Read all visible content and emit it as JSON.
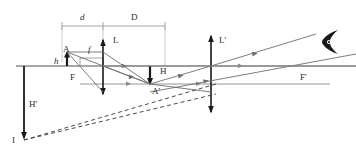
{
  "diagram": {
    "colors": {
      "axis": "#8a8a8a",
      "ray": "#6e6e6e",
      "dashed": "#4a4a4a",
      "object": "#1a1a1a",
      "lens": "#1a1a1a",
      "dimension": "#9a9a9a",
      "label": "#2b2b2b",
      "background": "#ffffff"
    },
    "labels": [
      {
        "id": "d",
        "text": "d",
        "x": 80,
        "y": 20,
        "italic": true
      },
      {
        "id": "D",
        "text": "D",
        "x": 131,
        "y": 20,
        "italic": false
      },
      {
        "id": "L",
        "text": "L",
        "x": 113,
        "y": 43,
        "italic": false
      },
      {
        "id": "f",
        "text": "f",
        "x": 88,
        "y": 52,
        "italic": true
      },
      {
        "id": "A",
        "text": "A",
        "x": 63,
        "y": 52,
        "italic": false
      },
      {
        "id": "h",
        "text": "h",
        "x": 54,
        "y": 64,
        "italic": true
      },
      {
        "id": "F",
        "text": "F",
        "x": 70,
        "y": 80,
        "italic": false
      },
      {
        "id": "H",
        "text": "H",
        "x": 160,
        "y": 74,
        "italic": false
      },
      {
        "id": "A-prime",
        "text": "A'",
        "x": 152,
        "y": 94,
        "italic": false
      },
      {
        "id": "L-prime",
        "text": "L'",
        "x": 219,
        "y": 43,
        "italic": false
      },
      {
        "id": "F-prime",
        "text": "F'",
        "x": 300,
        "y": 80,
        "italic": false
      },
      {
        "id": "H-prime",
        "text": "H'",
        "x": 29,
        "y": 107,
        "italic": false
      },
      {
        "id": "I",
        "text": "I",
        "x": 12,
        "y": 143,
        "italic": false
      }
    ],
    "geometry": {
      "principal_axis_y": 66,
      "secondary_axis_y": 84,
      "lens_L_x": 103,
      "lens_Lprime_x": 211,
      "object_x": 67,
      "image_x": 150,
      "focus_F_x": 80,
      "focus_Fprime_x": 303,
      "point_I": {
        "x": 24,
        "y": 140
      },
      "eye": {
        "x": 330,
        "y": 42
      },
      "dimension_line_y": 26,
      "dimension_from_x": 62,
      "dimension_to_x": 165,
      "f_bracket_y": 58,
      "f_bracket_from_x": 80,
      "f_bracket_to_x": 103
    }
  }
}
